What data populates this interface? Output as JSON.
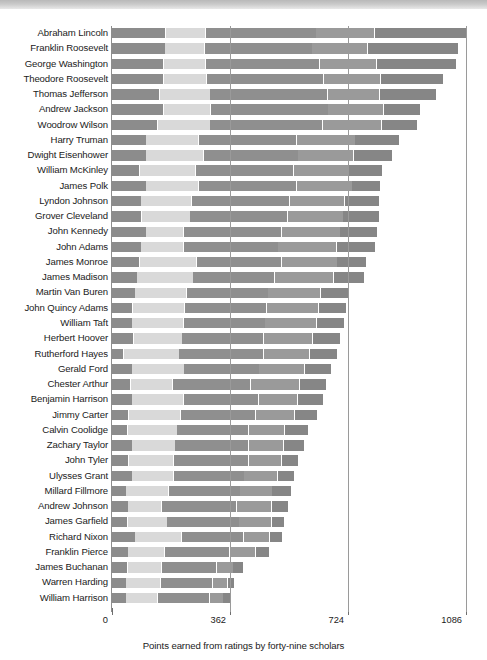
{
  "chart_data": {
    "type": "bar",
    "orientation": "horizontal",
    "stacked": true,
    "title": "",
    "xlabel": "Points earned from ratings by forty-nine scholars",
    "ylabel": "",
    "xlim": [
      0,
      1086
    ],
    "xticks": [
      0,
      362,
      724,
      1086
    ],
    "xticklabels": [
      "0",
      "362",
      "724",
      "1086"
    ],
    "grid": true,
    "legend": "none",
    "segment_colors": [
      "#8c8c8c",
      "#d9d9d9",
      "#8f8f8f",
      "#9a9a9a",
      "#868686"
    ],
    "categories": [
      "Abraham Lincoln",
      "Franklin Roosevelt",
      "George Washington",
      "Theodore Roosevelt",
      "Thomas Jefferson",
      "Andrew Jackson",
      "Woodrow Wilson",
      "Harry Truman",
      "Dwight Eisenhower",
      "William McKinley",
      "James Polk",
      "Lyndon Johnson",
      "Grover Cleveland",
      "John Kennedy",
      "John Adams",
      "James Monroe",
      "James Madison",
      "Martin Van Buren",
      "John Quincy Adams",
      "William Taft",
      "Herbert Hoover",
      "Rutherford Hayes",
      "Gerald Ford",
      "Chester Arthur",
      "Benjamin Harrison",
      "Jimmy Carter",
      "Calvin Coolidge",
      "Zachary Taylor",
      "John Tyler",
      "Ulysses Grant",
      "Millard Fillmore",
      "Andrew Johnson",
      "James Garfield",
      "Richard Nixon",
      "Franklin Pierce",
      "James Buchanan",
      "Warren Harding",
      "William Harrison"
    ],
    "values": [
      1086,
      1060,
      1054,
      1016,
      994,
      945,
      937,
      880,
      860,
      827,
      823,
      820,
      818,
      814,
      806,
      780,
      772,
      724,
      718,
      712,
      700,
      690,
      672,
      658,
      646,
      628,
      600,
      588,
      572,
      558,
      548,
      540,
      528,
      522,
      482,
      402,
      375,
      362
    ],
    "segments": [
      [
        165,
        122,
        340,
        180,
        279
      ],
      [
        164,
        120,
        330,
        170,
        276
      ],
      [
        158,
        130,
        350,
        175,
        241
      ],
      [
        158,
        132,
        360,
        175,
        191
      ],
      [
        147,
        155,
        360,
        160,
        172
      ],
      [
        158,
        146,
        360,
        170,
        111
      ],
      [
        140,
        162,
        345,
        180,
        110
      ],
      [
        105,
        162,
        300,
        180,
        133
      ],
      [
        105,
        177,
        290,
        170,
        118
      ],
      [
        86,
        172,
        300,
        170,
        99
      ],
      [
        105,
        162,
        300,
        170,
        86
      ],
      [
        90,
        155,
        300,
        170,
        105
      ],
      [
        92,
        148,
        300,
        170,
        108
      ],
      [
        105,
        115,
        300,
        180,
        114
      ],
      [
        90,
        130,
        290,
        180,
        116
      ],
      [
        86,
        175,
        260,
        170,
        89
      ],
      [
        78,
        172,
        250,
        180,
        92
      ],
      [
        72,
        158,
        250,
        160,
        84
      ],
      [
        64,
        160,
        250,
        160,
        84
      ],
      [
        62,
        158,
        250,
        158,
        84
      ],
      [
        66,
        150,
        250,
        150,
        84
      ],
      [
        36,
        170,
        260,
        140,
        84
      ],
      [
        62,
        160,
        230,
        140,
        80
      ],
      [
        58,
        128,
        240,
        150,
        82
      ],
      [
        62,
        158,
        230,
        120,
        76
      ],
      [
        52,
        160,
        230,
        118,
        68
      ],
      [
        48,
        152,
        220,
        110,
        70
      ],
      [
        62,
        132,
        226,
        108,
        60
      ],
      [
        52,
        138,
        230,
        100,
        52
      ],
      [
        62,
        128,
        216,
        102,
        50
      ],
      [
        44,
        130,
        220,
        98,
        56
      ],
      [
        50,
        102,
        230,
        108,
        50
      ],
      [
        48,
        122,
        220,
        100,
        38
      ],
      [
        72,
        142,
        190,
        80,
        38
      ],
      [
        50,
        112,
        200,
        80,
        40
      ],
      [
        48,
        104,
        170,
        50,
        30
      ],
      [
        44,
        106,
        160,
        45,
        20
      ],
      [
        44,
        96,
        160,
        42,
        20
      ]
    ]
  }
}
